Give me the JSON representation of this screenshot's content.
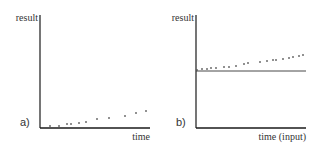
{
  "chart_data": [
    {
      "type": "scatter",
      "panel_label": "a)",
      "title": "",
      "xlabel": "time",
      "ylabel": "result",
      "grid": false,
      "reference_line": null,
      "points": [
        {
          "x": 50,
          "y": 126
        },
        {
          "x": 59,
          "y": 126
        },
        {
          "x": 67,
          "y": 124
        },
        {
          "x": 71,
          "y": 124
        },
        {
          "x": 79,
          "y": 123
        },
        {
          "x": 86,
          "y": 122
        },
        {
          "x": 97,
          "y": 119
        },
        {
          "x": 109,
          "y": 118
        },
        {
          "x": 125,
          "y": 116
        },
        {
          "x": 136,
          "y": 113
        },
        {
          "x": 146,
          "y": 111
        }
      ],
      "axes": {
        "origin": {
          "x": 40,
          "y": 128
        },
        "y_top": 15,
        "x_right": 150
      }
    },
    {
      "type": "scatter",
      "panel_label": "b)",
      "title": "",
      "xlabel": "time (input)",
      "ylabel": "result",
      "grid": false,
      "reference_line": {
        "y": 71,
        "x_from": 196,
        "x_to": 306
      },
      "points": [
        {
          "x": 197,
          "y": 70
        },
        {
          "x": 202,
          "y": 69
        },
        {
          "x": 207,
          "y": 69
        },
        {
          "x": 211,
          "y": 68
        },
        {
          "x": 216,
          "y": 68
        },
        {
          "x": 224,
          "y": 67
        },
        {
          "x": 229,
          "y": 67
        },
        {
          "x": 236,
          "y": 66
        },
        {
          "x": 244,
          "y": 64
        },
        {
          "x": 248,
          "y": 63
        },
        {
          "x": 260,
          "y": 62
        },
        {
          "x": 267,
          "y": 61
        },
        {
          "x": 273,
          "y": 60
        },
        {
          "x": 276,
          "y": 60
        },
        {
          "x": 283,
          "y": 59
        },
        {
          "x": 289,
          "y": 58
        },
        {
          "x": 293,
          "y": 57
        },
        {
          "x": 299,
          "y": 56
        },
        {
          "x": 303,
          "y": 55
        }
      ],
      "axes": {
        "origin": {
          "x": 196,
          "y": 128
        },
        "y_top": 15,
        "x_right": 306
      }
    }
  ],
  "colors": {
    "axis": "#1a1a1a",
    "point": "#555555",
    "text": "#333333"
  }
}
